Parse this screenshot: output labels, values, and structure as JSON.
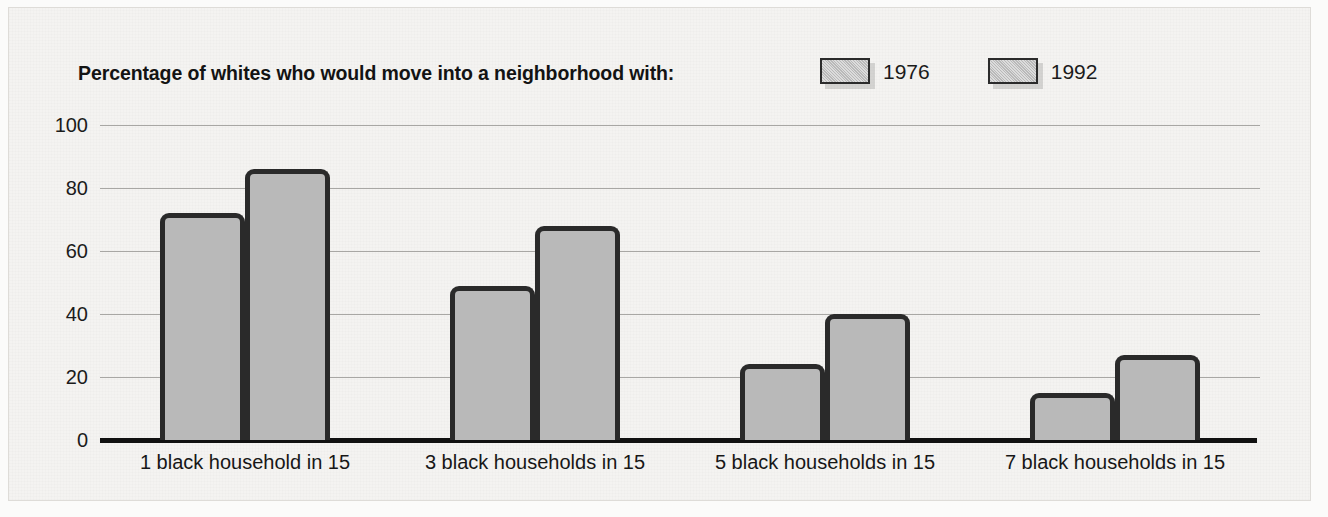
{
  "chart_data": {
    "type": "bar",
    "title": "Percentage of whites who would move into a neighborhood with:",
    "xlabel": "",
    "ylabel": "",
    "ylim": [
      0,
      100
    ],
    "yticks": [
      0,
      20,
      40,
      60,
      80,
      100
    ],
    "grid": true,
    "legend_position": "top-right",
    "categories": [
      "1 black household in 15",
      "3 black households in 15",
      "5 black households in 15",
      "7 black households in 15"
    ],
    "series": [
      {
        "name": "1976",
        "values": [
          72,
          49,
          24,
          15
        ],
        "color": "#b9b9b9"
      },
      {
        "name": "1992",
        "values": [
          86,
          68,
          40,
          27
        ],
        "color": "#b9b9b9"
      }
    ]
  },
  "axis": {
    "ytick_labels": [
      "100",
      "80",
      "60",
      "40",
      "20",
      "0"
    ]
  },
  "legend": {
    "items": [
      {
        "label": "1976"
      },
      {
        "label": "1992"
      }
    ]
  },
  "colors": {
    "bar_fill": "#b9b9b9",
    "bar_outline": "#2a2a2a",
    "axis": "#111111",
    "gridline": "#a8a7a4",
    "panel_background": "#f4f3f1",
    "text": "#171717"
  }
}
